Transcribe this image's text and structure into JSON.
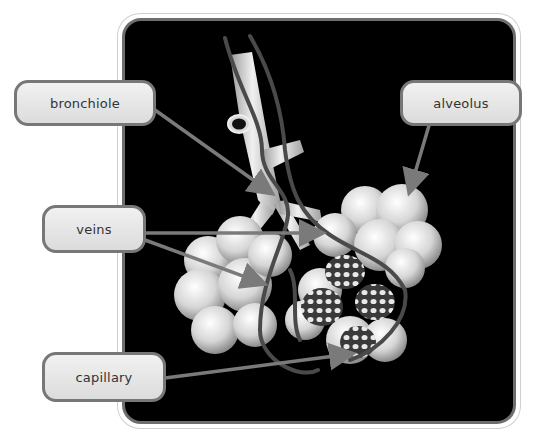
{
  "diagram": {
    "background_color": "#000000",
    "frame_border_color": "#6e6e6e",
    "label_fill": "#e6e6e6",
    "label_border": "#777777",
    "pointer_color": "#7a7a7a",
    "labels": [
      {
        "id": "bronchiole",
        "text": "bronchiole"
      },
      {
        "id": "alveolus",
        "text": "alveolus"
      },
      {
        "id": "veins",
        "text": "veins"
      },
      {
        "id": "capillary",
        "text": "capillary"
      }
    ]
  }
}
